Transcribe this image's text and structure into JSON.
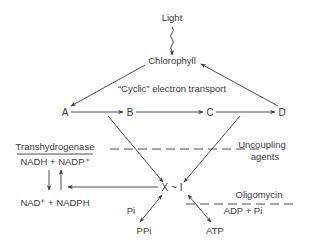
{
  "diagram": {
    "light": "Light",
    "chlorophyll": "Chlorophyll",
    "cyclic_label": "“Cyclic” electron transport",
    "nodes": {
      "a": "A",
      "b": "B",
      "c": "C",
      "d": "D",
      "xi": "X ~ I"
    },
    "transhydrogenase": {
      "title": "Transhydrogenase",
      "top": "NADH + NADP⁺",
      "bottom": "NAD⁺ + NADPH"
    },
    "uncoupling": {
      "line1": "Uncoupling",
      "line2": "agents"
    },
    "oligomycin": "Oligomycin",
    "adp_pi": "ADP + Pi",
    "pi": "Pi",
    "ppi": "PPi",
    "atp": "ATP",
    "colors": {
      "ink": "#3a3a3a",
      "background": "#ffffff"
    }
  }
}
